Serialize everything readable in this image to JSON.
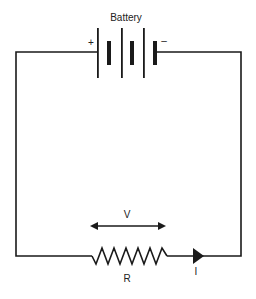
{
  "diagram": {
    "type": "circuit",
    "labels": {
      "battery": "Battery",
      "positive": "+",
      "negative": "–",
      "voltage": "V",
      "resistor": "R",
      "current": "I"
    },
    "components": [
      {
        "id": "battery",
        "kind": "battery",
        "cells": 3,
        "label": "Battery"
      },
      {
        "id": "resistor",
        "kind": "resistor",
        "label": "R"
      },
      {
        "id": "voltage-indicator",
        "kind": "double-arrow",
        "label": "V"
      },
      {
        "id": "current-arrow",
        "kind": "current-direction",
        "direction": "right",
        "label": "I"
      }
    ],
    "colors": {
      "line": "#1a1a1a",
      "background": "#ffffff"
    }
  }
}
